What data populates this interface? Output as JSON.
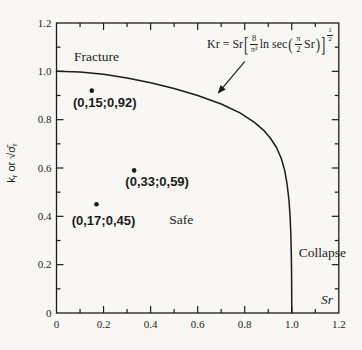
{
  "chart_data": {
    "type": "line",
    "title": "",
    "xlabel": "Sr",
    "ylabel": "kr or √σ̄r",
    "xlim": [
      0,
      1.2
    ],
    "ylim": [
      0,
      1.2
    ],
    "grid": false,
    "ticks": {
      "major": [
        0,
        0.2,
        0.4,
        0.6,
        0.8,
        1.0,
        1.2
      ],
      "minor": [
        0.1,
        0.3,
        0.5,
        0.7,
        0.9,
        1.1
      ],
      "labels": [
        "0",
        "0.2",
        "0.4",
        "0.6",
        "0.8",
        "1.0",
        "1.2"
      ]
    },
    "boundary_curve": {
      "name": "fracture-collapse boundary",
      "points": [
        [
          0,
          1.0
        ],
        [
          0.1,
          0.997
        ],
        [
          0.2,
          0.988
        ],
        [
          0.3,
          0.973
        ],
        [
          0.4,
          0.953
        ],
        [
          0.5,
          0.929
        ],
        [
          0.6,
          0.9
        ],
        [
          0.7,
          0.865
        ],
        [
          0.78,
          0.828
        ],
        [
          0.84,
          0.79
        ],
        [
          0.88,
          0.757
        ],
        [
          0.91,
          0.722
        ],
        [
          0.935,
          0.685
        ],
        [
          0.955,
          0.64
        ],
        [
          0.97,
          0.59
        ],
        [
          0.98,
          0.535
        ],
        [
          0.988,
          0.47
        ],
        [
          0.993,
          0.4
        ],
        [
          0.996,
          0.33
        ],
        [
          0.998,
          0.25
        ],
        [
          0.9995,
          0.15
        ],
        [
          1.0,
          0
        ]
      ]
    },
    "points": [
      {
        "x": 0.15,
        "y": 0.92,
        "label": "(0,15;0,92)",
        "label_dx": 13,
        "label_dy": 16
      },
      {
        "x": 0.33,
        "y": 0.59,
        "label": "(0,33;0,59)",
        "label_dx": 23,
        "label_dy": 16
      },
      {
        "x": 0.17,
        "y": 0.45,
        "label": "(0,17;0,45)",
        "label_dx": 7,
        "label_dy": 21
      }
    ],
    "regions": [
      {
        "label": "Fracture",
        "x": 0.17,
        "y": 1.06
      },
      {
        "label": "Safe",
        "x": 0.53,
        "y": 0.385
      },
      {
        "label": "Collapse",
        "x": 1.13,
        "y": 0.25
      }
    ],
    "x_axis_title": {
      "text": "Sr",
      "x": 1.15,
      "y": 0.055
    },
    "arrow": {
      "from": [
        0.8,
        1.04
      ],
      "to": [
        0.685,
        0.907
      ]
    },
    "equation_plain": "Kr = Sr[8/π² ln sec(π/2 Sr)]^(1/2)",
    "equation": {
      "lhs": "Kr = Sr",
      "lbracket": "[",
      "frac1_num": "8",
      "frac1_den": "π²",
      "mid": "ln sec",
      "lparen": "(",
      "frac2_num": "π",
      "frac2_den": "2",
      "arg": "Sr",
      "rparen": ")",
      "rbracket": "]",
      "exp_num": "1",
      "exp_den": "2"
    },
    "ylabel_parts": {
      "k": "k",
      "k_sub": "r",
      "or": " or ",
      "radical": "√",
      "sigma": "σ̄",
      "sigma_sub": "r"
    },
    "colors": {
      "ink": "#1c1c1c",
      "background": "#f8f7f4"
    }
  }
}
